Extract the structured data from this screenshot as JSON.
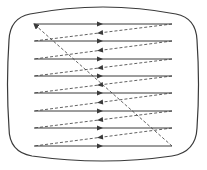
{
  "diagram": {
    "type": "raster-scan",
    "colors": {
      "stroke": "#3a3a3a",
      "background": "#ffffff"
    },
    "scan_lines": {
      "count": 8,
      "x_start": 34,
      "x_end": 172,
      "y_positions": [
        24,
        41,
        59,
        76,
        93,
        111,
        128,
        146
      ],
      "arrow_x": 100,
      "style": "solid"
    },
    "retrace_lines": {
      "style": "dashed",
      "arrow_x": 100
    },
    "vertical_retrace": {
      "from": [
        172,
        146
      ],
      "to": [
        34,
        24
      ],
      "style": "dashed"
    }
  }
}
